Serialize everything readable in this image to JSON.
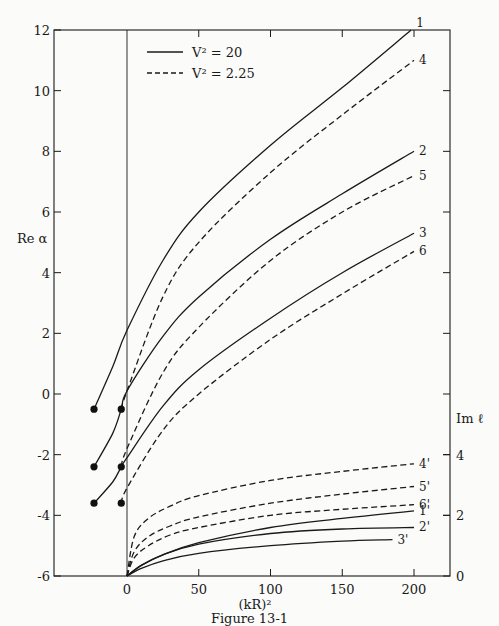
{
  "chart_data": {
    "type": "line",
    "title": "",
    "caption": "Figure 13-1",
    "xlabel": "(kR)²",
    "ylabel_left": "Re α",
    "ylabel_right": "Im ℓ",
    "xlim": [
      -51,
      225
    ],
    "ylim_left": [
      -6,
      12
    ],
    "ylim_right": [
      0,
      6
    ],
    "x_ticks": [
      0,
      50,
      100,
      150,
      200
    ],
    "y_ticks_left": [
      -6,
      -4,
      -2,
      0,
      2,
      4,
      6,
      8,
      10,
      12
    ],
    "y_ticks_right": [
      0,
      2,
      4
    ],
    "grid": false,
    "legend": [
      {
        "label": "V² = 20",
        "style": "solid"
      },
      {
        "label": "V² = 2.25",
        "style": "dashed"
      }
    ],
    "legend_position": "top-left",
    "series": [
      {
        "name": "1",
        "axis": "left",
        "style": "solid",
        "x": [
          -23,
          -10,
          0,
          25,
          50,
          100,
          150,
          198
        ],
        "y": [
          -0.5,
          0.9,
          2.1,
          4.4,
          6.0,
          8.2,
          10.1,
          12.0
        ]
      },
      {
        "name": "4",
        "axis": "left",
        "style": "dashed",
        "x": [
          -4,
          0,
          25,
          50,
          100,
          150,
          200
        ],
        "y": [
          -0.5,
          0.1,
          3.2,
          5.0,
          7.3,
          9.2,
          11.0
        ]
      },
      {
        "name": "2",
        "axis": "left",
        "style": "solid",
        "x": [
          -23,
          -10,
          -4,
          0,
          25,
          50,
          100,
          150,
          200
        ],
        "y": [
          -2.4,
          -1.3,
          -0.5,
          0.1,
          1.9,
          3.2,
          5.1,
          6.6,
          8.0
        ]
      },
      {
        "name": "5",
        "axis": "left",
        "style": "dashed",
        "x": [
          -4,
          0,
          25,
          50,
          100,
          150,
          200
        ],
        "y": [
          -2.4,
          -1.8,
          0.7,
          2.2,
          4.4,
          6.0,
          7.2
        ]
      },
      {
        "name": "3",
        "axis": "left",
        "style": "solid",
        "x": [
          -23,
          -10,
          -4,
          0,
          25,
          50,
          100,
          150,
          200
        ],
        "y": [
          -3.6,
          -2.9,
          -2.4,
          -2.1,
          -0.4,
          0.8,
          2.5,
          4.0,
          5.3
        ]
      },
      {
        "name": "6",
        "axis": "left",
        "style": "dashed",
        "x": [
          -4,
          0,
          25,
          50,
          100,
          150,
          200
        ],
        "y": [
          -3.6,
          -3.1,
          -1.2,
          0.0,
          1.8,
          3.3,
          4.7
        ]
      },
      {
        "name": "4'",
        "axis": "right",
        "style": "dashed",
        "x": [
          0,
          5,
          15,
          30,
          50,
          100,
          150,
          200
        ],
        "y": [
          0,
          1.3,
          1.9,
          2.3,
          2.65,
          3.15,
          3.45,
          3.7
        ]
      },
      {
        "name": "5'",
        "axis": "right",
        "style": "dashed",
        "x": [
          0,
          5,
          15,
          30,
          50,
          100,
          150,
          200
        ],
        "y": [
          0,
          0.8,
          1.3,
          1.65,
          1.95,
          2.4,
          2.7,
          2.95
        ]
      },
      {
        "name": "6'",
        "axis": "right",
        "style": "dashed",
        "x": [
          0,
          5,
          15,
          30,
          50,
          100,
          150,
          200
        ],
        "y": [
          0,
          0.6,
          1.0,
          1.35,
          1.6,
          2.0,
          2.2,
          2.35
        ]
      },
      {
        "name": "1'",
        "axis": "right",
        "style": "solid",
        "x": [
          0,
          10,
          25,
          50,
          100,
          150,
          200
        ],
        "y": [
          0,
          0.35,
          0.7,
          1.1,
          1.6,
          1.9,
          2.15
        ]
      },
      {
        "name": "2'",
        "axis": "right",
        "style": "solid",
        "x": [
          0,
          10,
          25,
          50,
          100,
          150,
          200
        ],
        "y": [
          0,
          0.35,
          0.7,
          1.05,
          1.4,
          1.55,
          1.6
        ]
      },
      {
        "name": "3'",
        "axis": "right",
        "style": "solid",
        "x": [
          0,
          10,
          25,
          50,
          100,
          150,
          185
        ],
        "y": [
          0,
          0.25,
          0.5,
          0.75,
          1.0,
          1.15,
          1.2
        ]
      }
    ],
    "markers": [
      {
        "x": -23,
        "y": -0.5
      },
      {
        "x": -4,
        "y": -0.5
      },
      {
        "x": -23,
        "y": -2.4
      },
      {
        "x": -4,
        "y": -2.4
      },
      {
        "x": -23,
        "y": -3.6
      },
      {
        "x": -4,
        "y": -3.6
      }
    ]
  }
}
